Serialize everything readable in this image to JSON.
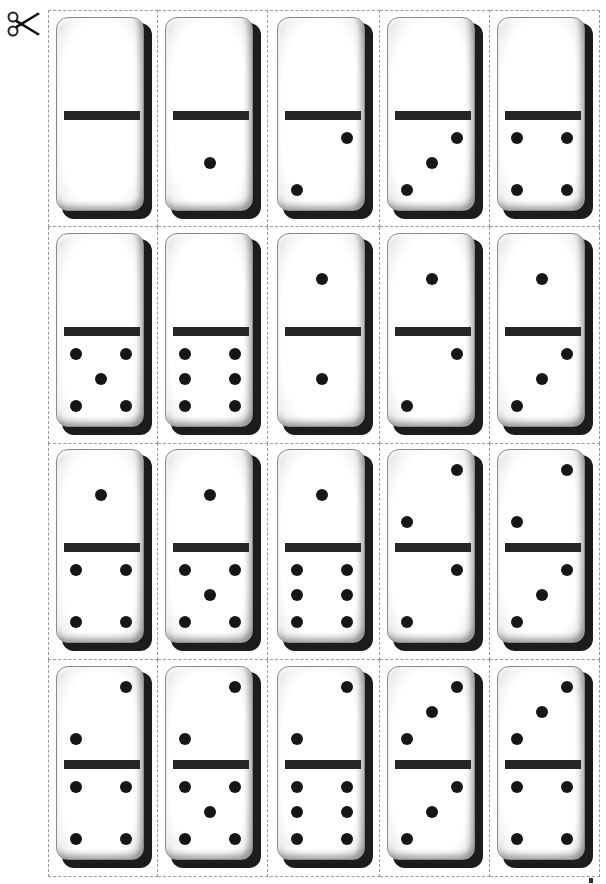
{
  "page": {
    "cut_marker_icon": "scissors-icon",
    "layout": {
      "columns": 5,
      "rows": 4,
      "cell_border": "dashed",
      "border_color": "#9a9a9a"
    },
    "colors": {
      "pip": "#161616",
      "bar": "#262626",
      "shadow": "#1c1c1c",
      "tile": "#ffffff"
    }
  },
  "dominoes": [
    {
      "top": 0,
      "bottom": 0
    },
    {
      "top": 0,
      "bottom": 1
    },
    {
      "top": 0,
      "bottom": 2
    },
    {
      "top": 0,
      "bottom": 3
    },
    {
      "top": 0,
      "bottom": 4
    },
    {
      "top": 0,
      "bottom": 5
    },
    {
      "top": 0,
      "bottom": 6
    },
    {
      "top": 1,
      "bottom": 1
    },
    {
      "top": 1,
      "bottom": 2
    },
    {
      "top": 1,
      "bottom": 3
    },
    {
      "top": 1,
      "bottom": 4
    },
    {
      "top": 1,
      "bottom": 5
    },
    {
      "top": 1,
      "bottom": 6
    },
    {
      "top": 2,
      "bottom": 2
    },
    {
      "top": 2,
      "bottom": 3
    },
    {
      "top": 2,
      "bottom": 4
    },
    {
      "top": 2,
      "bottom": 5
    },
    {
      "top": 2,
      "bottom": 6
    },
    {
      "top": 3,
      "bottom": 3
    },
    {
      "top": 3,
      "bottom": 4
    }
  ]
}
